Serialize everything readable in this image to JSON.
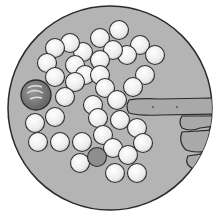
{
  "scene": {
    "title": "Marbles in a circle with a pointing finger",
    "colors": {
      "background": "#ffffff",
      "disc_fill": "#b4b4b4",
      "disc_stroke": "#2a2a2a",
      "marble_fill": "#f2f2f2",
      "marble_stroke": "#2f2f2f",
      "shooter_fill": "#7a7a7a",
      "finger_fill": "#a9a9a9",
      "dark_marble_fill": "#8e8e8e"
    },
    "counts": {
      "small_marbles": 38,
      "large_marble": 1,
      "dark_small_marbles": 1
    },
    "objects": {
      "shooter_marble": "large-dark-marble",
      "hand": "pointing-finger"
    }
  }
}
